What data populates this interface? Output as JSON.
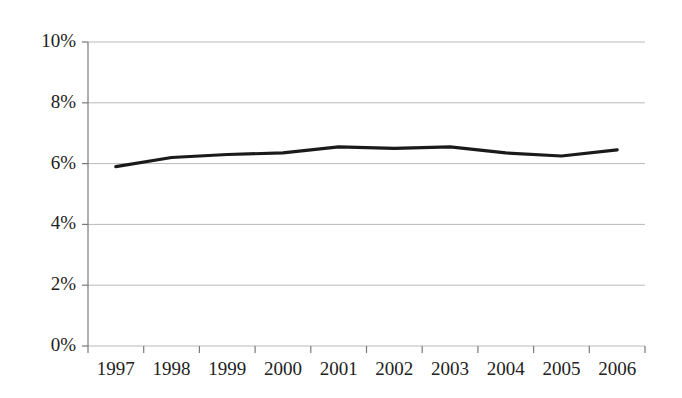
{
  "chart_data": {
    "type": "line",
    "title": "",
    "subtitle": "",
    "xlabel": "",
    "ylabel": "",
    "categories": [
      "1997",
      "1998",
      "1999",
      "2000",
      "2001",
      "2002",
      "2003",
      "2004",
      "2005",
      "2006"
    ],
    "x": [
      1997,
      1998,
      1999,
      2000,
      2001,
      2002,
      2003,
      2004,
      2005,
      2006
    ],
    "values": [
      5.9,
      6.2,
      6.3,
      6.35,
      6.55,
      6.5,
      6.55,
      6.35,
      6.25,
      6.45
    ],
    "series": [
      {
        "name": "",
        "values": [
          5.9,
          6.2,
          6.3,
          6.35,
          6.55,
          6.5,
          6.55,
          6.35,
          6.25,
          6.45
        ]
      }
    ],
    "ylim": [
      0,
      10
    ],
    "yticks": [
      0,
      2,
      4,
      6,
      8,
      10
    ],
    "ytick_labels": [
      "0%",
      "2%",
      "4%",
      "6%",
      "8%",
      "10%"
    ],
    "xtick_labels": [
      "1997",
      "1998",
      "1999",
      "2000",
      "2001",
      "2002",
      "2003",
      "2004",
      "2005",
      "2006"
    ],
    "grid": true,
    "grid_axis": "y",
    "legend": false,
    "legend_position": "none",
    "value_format": "percent",
    "line_color": "#1a1a1a",
    "grid_color": "#b9b9b9",
    "axis_color": "#7a7a7a",
    "background_color": "#ffffff",
    "annotations": []
  }
}
